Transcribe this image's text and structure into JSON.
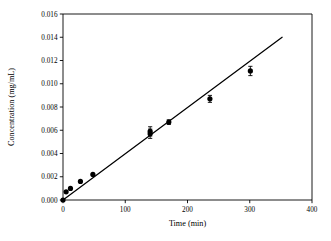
{
  "chart_data": {
    "type": "scatter",
    "title": "",
    "xlabel": "Time (min)",
    "ylabel": "Concentration (mg/mL)",
    "xlim": [
      0,
      400
    ],
    "ylim": [
      0.0,
      0.016
    ],
    "xticks": [
      0,
      100,
      200,
      300,
      400
    ],
    "xtick_labels": [
      "0",
      "100",
      "200",
      "300",
      "400"
    ],
    "yticks": [
      0.0,
      0.002,
      0.004,
      0.006,
      0.008,
      0.01,
      0.012,
      0.014,
      0.016
    ],
    "ytick_labels": [
      "0.000",
      "0.002",
      "0.004",
      "0.006",
      "0.008",
      "0.010",
      "0.012",
      "0.014",
      "0.016"
    ],
    "grid": false,
    "legend": null,
    "marker": "filled-circle",
    "marker_color": "#000000",
    "line_color": "#000000",
    "x": [
      0,
      5,
      12,
      28,
      48,
      140,
      140,
      170,
      236,
      301
    ],
    "y": [
      0.0,
      0.0007,
      0.001,
      0.0016,
      0.0022,
      0.0057,
      0.0059,
      0.0067,
      0.0087,
      0.0111
    ],
    "yerr": [
      0.0,
      0.0,
      0.0,
      0.0,
      0.0,
      0.0004,
      0.0004,
      0.0002,
      0.0003,
      0.0004
    ],
    "fit_line": {
      "type": "line",
      "x": [
        0,
        352
      ],
      "y": [
        0.0,
        0.014
      ],
      "slope": 3.977e-05,
      "intercept": 0.0
    }
  }
}
